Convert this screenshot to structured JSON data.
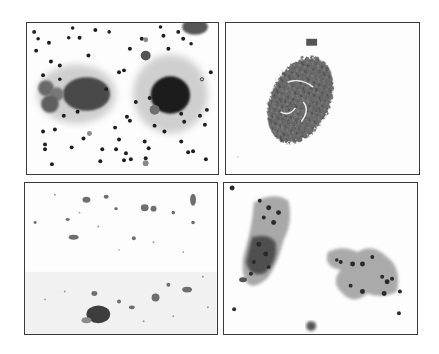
{
  "figure": {
    "layout": "2x2 grid of grayscale cytology micrographs",
    "panels": [
      {
        "id": "top-left",
        "content": "two dark cell clusters with scattered small dark round cells",
        "background": "#fdfdfd"
      },
      {
        "id": "top-right",
        "content": "single oval dense tissue fragment",
        "background": "#fdfdfd"
      },
      {
        "id": "bottom-left",
        "content": "sparse debris with small dark cell near bottom",
        "background": "#fdfdfd"
      },
      {
        "id": "bottom-right",
        "content": "two irregular cell clusters",
        "background": "#fdfdfd"
      }
    ],
    "colors": {
      "border": "#3a3a3a",
      "dark_stain": "#1e1e1e",
      "mid_stain": "#6a6a6a",
      "light_stain": "#b8b8b8"
    }
  }
}
